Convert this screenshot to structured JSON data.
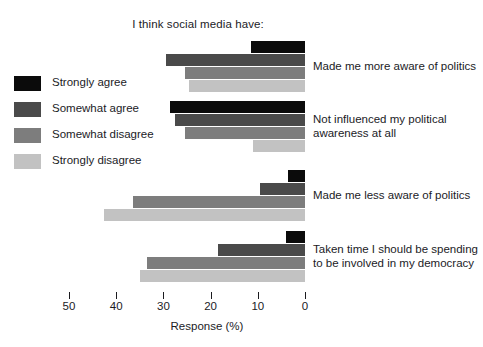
{
  "chart_data": {
    "type": "bar",
    "orientation": "horizontal",
    "title": "I think social media have:",
    "xlabel": "Response (%)",
    "ylabel": "",
    "xlim": [
      50,
      0
    ],
    "x_axis_reversed": true,
    "grid": false,
    "legend_position": "left",
    "tick_labels": [
      "50",
      "40",
      "30",
      "20",
      "10",
      "0"
    ],
    "tick_values": [
      50,
      40,
      30,
      20,
      10,
      0
    ],
    "categories": [
      "Made me more aware of politics",
      "Not influenced my political awareness at all",
      "Made me less aware of politics",
      "Taken time I should be spending to be involved in my democracy"
    ],
    "category_lines": [
      [
        "Made me more aware of politics"
      ],
      [
        "Not influenced my political",
        "awareness at all"
      ],
      [
        "Made me less aware of politics"
      ],
      [
        "Taken time I should be spending",
        "to be involved in my democracy"
      ]
    ],
    "series": [
      {
        "name": "Strongly agree",
        "color": "#0b0b0b",
        "values": [
          11.5,
          28.5,
          3.5,
          4.0
        ]
      },
      {
        "name": "Somewhat agree",
        "color": "#4a4a4a",
        "values": [
          29.5,
          27.5,
          9.5,
          18.5
        ]
      },
      {
        "name": "Somewhat disagree",
        "color": "#7d7d7d",
        "values": [
          25.5,
          25.5,
          36.5,
          33.5
        ]
      },
      {
        "name": "Strongly disagree",
        "color": "#c2c2c2",
        "values": [
          24.5,
          11.0,
          42.5,
          35.0
        ]
      }
    ]
  },
  "legend": {
    "items": [
      {
        "label": "Strongly agree",
        "color": "#0b0b0b"
      },
      {
        "label": "Somewhat agree",
        "color": "#4a4a4a"
      },
      {
        "label": "Somewhat disagree",
        "color": "#7d7d7d"
      },
      {
        "label": "Strongly disagree",
        "color": "#c2c2c2"
      }
    ]
  },
  "footnote": {
    "text": ""
  }
}
